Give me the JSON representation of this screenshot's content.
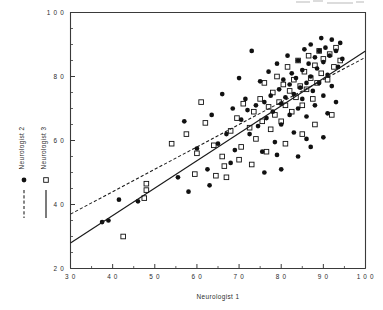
{
  "chart_data": {
    "type": "scatter",
    "title": "",
    "xlabel": "Neurologist 1",
    "ylabel": "",
    "xlim": [
      30,
      100
    ],
    "ylim": [
      20,
      100
    ],
    "xticks": [
      30,
      40,
      50,
      60,
      70,
      80,
      90,
      100
    ],
    "xticklabels": [
      "3 0",
      "4 0",
      "5 0",
      "6 0",
      "7 0",
      "8 0",
      "9 0",
      "1 0 0"
    ],
    "yticks": [
      20,
      40,
      60,
      80,
      100
    ],
    "yticklabels": [
      "2 0",
      "4 0",
      "6 0",
      "8 0",
      "1 0 0"
    ],
    "yticks_minor": [
      25,
      30,
      35,
      45,
      50,
      55,
      65,
      70,
      75,
      85,
      90,
      95
    ],
    "grid": false,
    "legend_position": "left-outside",
    "series": [
      {
        "name": "Neurologist 2",
        "marker": "filled-circle",
        "line": "dashed",
        "color": "#111111",
        "fit_line": {
          "x": [
            30,
            100
          ],
          "y": [
            37.0,
            86.0
          ]
        },
        "points": [
          [
            37.5,
            34.5
          ],
          [
            39.0,
            35.0
          ],
          [
            41.5,
            41.5
          ],
          [
            46.0,
            41.0
          ],
          [
            55.5,
            48.5
          ],
          [
            57.0,
            66.0
          ],
          [
            60.0,
            57.5
          ],
          [
            62.5,
            51.0
          ],
          [
            63.5,
            68.0
          ],
          [
            65.0,
            59.0
          ],
          [
            66.0,
            74.5
          ],
          [
            67.0,
            62.0
          ],
          [
            68.5,
            70.0
          ],
          [
            69.0,
            57.0
          ],
          [
            70.0,
            79.5
          ],
          [
            70.5,
            66.5
          ],
          [
            71.5,
            73.0
          ],
          [
            72.0,
            69.5
          ],
          [
            72.5,
            62.0
          ],
          [
            73.0,
            88.0
          ],
          [
            74.0,
            71.0
          ],
          [
            74.5,
            64.5
          ],
          [
            75.0,
            78.5
          ],
          [
            75.5,
            56.5
          ],
          [
            76.0,
            72.0
          ],
          [
            76.5,
            67.0
          ],
          [
            77.0,
            81.5
          ],
          [
            77.5,
            74.0
          ],
          [
            78.0,
            69.0
          ],
          [
            78.5,
            59.5
          ],
          [
            79.0,
            84.0
          ],
          [
            79.5,
            76.0
          ],
          [
            80.0,
            71.5
          ],
          [
            80.0,
            65.0
          ],
          [
            80.5,
            79.0
          ],
          [
            81.0,
            73.5
          ],
          [
            81.5,
            86.5
          ],
          [
            82.0,
            68.0
          ],
          [
            82.0,
            77.5
          ],
          [
            82.5,
            81.0
          ],
          [
            83.0,
            74.5
          ],
          [
            83.0,
            62.5
          ],
          [
            83.5,
            79.5
          ],
          [
            84.0,
            85.0
          ],
          [
            84.0,
            70.0
          ],
          [
            84.5,
            76.5
          ],
          [
            85.0,
            82.0
          ],
          [
            85.0,
            73.0
          ],
          [
            85.5,
            88.5
          ],
          [
            86.0,
            78.0
          ],
          [
            86.0,
            67.5
          ],
          [
            86.5,
            84.0
          ],
          [
            87.0,
            80.0
          ],
          [
            87.0,
            90.0
          ],
          [
            87.5,
            75.5
          ],
          [
            88.0,
            86.0
          ],
          [
            88.0,
            71.0
          ],
          [
            88.5,
            82.5
          ],
          [
            89.0,
            88.0
          ],
          [
            89.0,
            78.0
          ],
          [
            89.5,
            92.0
          ],
          [
            90.0,
            84.5
          ],
          [
            90.0,
            74.0
          ],
          [
            90.5,
            89.0
          ],
          [
            91.0,
            80.5
          ],
          [
            91.5,
            86.5
          ],
          [
            92.0,
            91.5
          ],
          [
            92.0,
            77.0
          ],
          [
            93.0,
            88.0
          ],
          [
            93.5,
            83.0
          ],
          [
            94.0,
            90.5
          ],
          [
            94.5,
            85.5
          ],
          [
            80.0,
            51.0
          ],
          [
            84.0,
            55.0
          ],
          [
            87.0,
            58.0
          ],
          [
            90.0,
            61.0
          ],
          [
            76.0,
            50.0
          ],
          [
            68.0,
            53.0
          ],
          [
            63.0,
            46.0
          ],
          [
            58.0,
            44.0
          ],
          [
            91.0,
            68.5
          ],
          [
            93.0,
            72.0
          ],
          [
            86.0,
            60.5
          ],
          [
            79.0,
            55.5
          ]
        ]
      },
      {
        "name": "Neurologist 3",
        "marker": "open-square",
        "line": "solid",
        "color": "#111111",
        "fit_line": {
          "x": [
            30,
            100
          ],
          "y": [
            28.0,
            88.0
          ]
        },
        "points": [
          [
            42.5,
            30.0
          ],
          [
            47.5,
            42.0
          ],
          [
            48.0,
            44.5
          ],
          [
            48.0,
            46.5
          ],
          [
            54.0,
            59.0
          ],
          [
            59.5,
            49.5
          ],
          [
            62.0,
            65.5
          ],
          [
            64.5,
            49.0
          ],
          [
            66.0,
            55.0
          ],
          [
            67.0,
            48.5
          ],
          [
            68.0,
            63.0
          ],
          [
            69.5,
            67.0
          ],
          [
            70.5,
            58.0
          ],
          [
            71.0,
            71.5
          ],
          [
            72.5,
            64.0
          ],
          [
            73.5,
            69.0
          ],
          [
            74.0,
            60.5
          ],
          [
            75.0,
            73.0
          ],
          [
            75.5,
            66.0
          ],
          [
            76.0,
            78.0
          ],
          [
            77.0,
            70.5
          ],
          [
            77.5,
            63.5
          ],
          [
            78.0,
            75.0
          ],
          [
            78.5,
            68.0
          ],
          [
            79.0,
            80.0
          ],
          [
            79.5,
            72.0
          ],
          [
            80.0,
            66.0
          ],
          [
            80.5,
            77.5
          ],
          [
            81.0,
            71.0
          ],
          [
            81.5,
            83.0
          ],
          [
            82.0,
            75.5
          ],
          [
            82.5,
            69.0
          ],
          [
            83.0,
            79.0
          ],
          [
            83.5,
            73.5
          ],
          [
            84.0,
            85.0
          ],
          [
            84.5,
            77.0
          ],
          [
            85.0,
            71.0
          ],
          [
            85.5,
            81.5
          ],
          [
            86.0,
            76.0
          ],
          [
            86.5,
            86.5
          ],
          [
            87.0,
            79.5
          ],
          [
            87.5,
            73.0
          ],
          [
            88.0,
            83.5
          ],
          [
            88.5,
            78.0
          ],
          [
            89.0,
            88.0
          ],
          [
            89.5,
            81.0
          ],
          [
            90.0,
            85.5
          ],
          [
            91.0,
            79.0
          ],
          [
            91.5,
            87.0
          ],
          [
            92.5,
            83.0
          ],
          [
            93.0,
            89.0
          ],
          [
            94.0,
            85.0
          ],
          [
            60.0,
            56.0
          ],
          [
            64.0,
            58.5
          ],
          [
            66.5,
            52.0
          ],
          [
            70.0,
            54.0
          ],
          [
            73.0,
            52.5
          ],
          [
            76.5,
            56.5
          ],
          [
            81.0,
            59.0
          ],
          [
            85.0,
            62.0
          ],
          [
            88.0,
            65.0
          ],
          [
            92.0,
            68.0
          ],
          [
            57.5,
            62.0
          ],
          [
            61.0,
            72.0
          ]
        ]
      }
    ],
    "legend": [
      {
        "label": "Neurologist 2",
        "marker": "filled-circle",
        "line": "dashed"
      },
      {
        "label": "Neurologist 3",
        "marker": "open-square",
        "line": "solid"
      }
    ]
  }
}
